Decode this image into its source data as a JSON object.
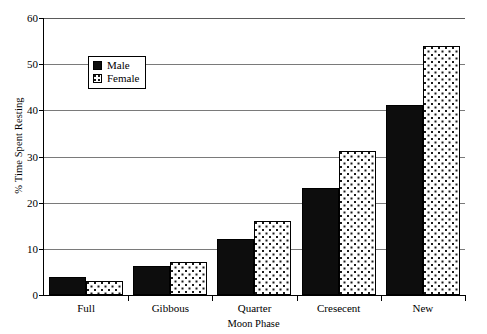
{
  "chart_data": {
    "type": "bar",
    "title": "",
    "xlabel": "Moon Phase",
    "ylabel": "% Time Spent Resting",
    "categories": [
      "Full",
      "Gibbous",
      "Quarter",
      "Cresecent",
      "New"
    ],
    "series": [
      {
        "name": "Male",
        "values": [
          4.0,
          6.3,
          12.1,
          23.2,
          41.2
        ],
        "fill": "solid-black",
        "color": "#0d0d0d"
      },
      {
        "name": "Female",
        "values": [
          3.0,
          7.1,
          16.1,
          31.1,
          54.0
        ],
        "fill": "dotted-white",
        "color": "#ffffff"
      }
    ],
    "ylim": [
      0,
      60
    ],
    "yticks": [
      0,
      10,
      20,
      30,
      40,
      50,
      60
    ],
    "ytick_labels": [
      "0",
      "10",
      "20",
      "30",
      "40",
      "50",
      "60"
    ],
    "grid": "horizontal",
    "legend_position": "upper-left-inside",
    "legend_entries": [
      "Male",
      "Female"
    ]
  }
}
